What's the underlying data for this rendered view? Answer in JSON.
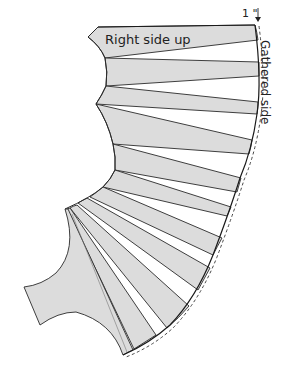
{
  "diagram": {
    "type": "sewing-pattern-slash-and-spread",
    "labels": {
      "right_side_up": "Right side up",
      "gathered_side": "Gathered side",
      "seam_allowance": "1 \""
    },
    "colors": {
      "fill": "#dcdcdc",
      "outline": "#2a2a2a",
      "background": "#ffffff"
    },
    "pieces_count": 10,
    "has_bottom_lobe": true,
    "dashed_offset_line": true
  }
}
